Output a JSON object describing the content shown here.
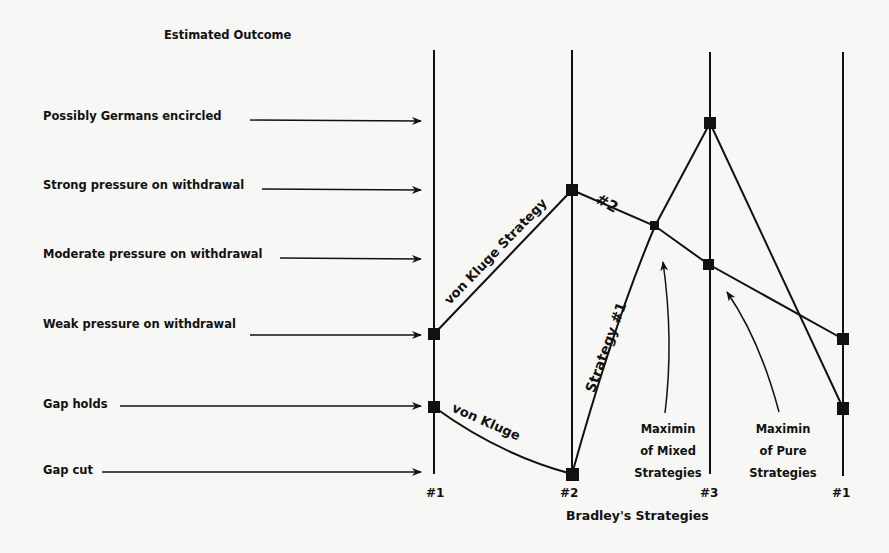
{
  "diagram": {
    "title": "Estimated Outcome",
    "outcomes": [
      {
        "label": "Possibly Germans encircled",
        "y": 117
      },
      {
        "label": "Strong pressure on withdrawal",
        "y": 189
      },
      {
        "label": "Moderate pressure on withdrawal",
        "y": 257
      },
      {
        "label": "Weak pressure on withdrawal",
        "y": 334
      },
      {
        "label": "Gap holds",
        "y": 407
      },
      {
        "label": "Gap cut",
        "y": 474
      }
    ],
    "axes": [
      {
        "label": "#1",
        "x": 434
      },
      {
        "label": "#2",
        "x": 572
      },
      {
        "label": "#3",
        "x": 710
      },
      {
        "label": "#1",
        "x": 843
      }
    ],
    "x_axis_title": "Bradley's Strategies",
    "lines": [
      {
        "label": "von Kluge Strategy #2",
        "path_labels": [
          "von Kluge Strategy",
          "#2"
        ]
      },
      {
        "label": "von Kluge Strategy #1",
        "path_labels": [
          "von Kluge",
          "Strategy #1"
        ]
      }
    ],
    "annotations": [
      {
        "label": "Maximin of Mixed Strategies",
        "lines": [
          "Maximin",
          "of Mixed",
          "Strategies"
        ]
      },
      {
        "label": "Maximin of Pure Strategies",
        "lines": [
          "Maximin",
          "of Pure",
          "Strategies"
        ]
      }
    ],
    "colors": {
      "ink": "#111111",
      "paper": "#f7f7f5"
    }
  }
}
